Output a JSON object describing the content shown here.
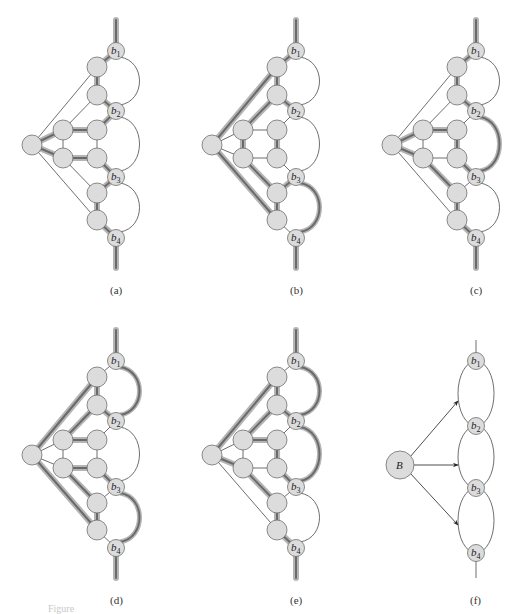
{
  "figure": {
    "colors": {
      "node_fill": "#dcdcdc",
      "node_stroke": "#6e6e6e",
      "thin_edge": "#4a4a4a",
      "highlight_outer": "#b5b5b5",
      "highlight_inner": "#6a6a6a",
      "background": "#ffffff"
    },
    "panels": [
      {
        "id": "a",
        "label": "(a)",
        "highlighted_paths": "root→inner-left-upper→inner-right-upper→b2; root→inner-left-lower→inner-right-lower→b3; chain b1–top1–top2–b2; chain b3–bot1–bot2–b4; stems",
        "highlighted_arcs": []
      },
      {
        "id": "b",
        "label": "(b)",
        "highlighted_paths": "root→top1 chain, root→bot2 chain, diagonals, vertical inner edges",
        "highlighted_arcs": [
          "b3-b4"
        ]
      },
      {
        "id": "c",
        "label": "(c)",
        "highlighted_paths": "root→inner upper/lower, inner-left-lower→bot1 diagonal",
        "highlighted_arcs": [
          "b2-b3"
        ]
      },
      {
        "id": "d",
        "label": "(d)",
        "highlighted_paths": "both outer diagonals, inner diagonals, horizontal edges",
        "highlighted_arcs": [
          "b1-b2",
          "b3-b4"
        ]
      },
      {
        "id": "e",
        "label": "(e)",
        "highlighted_paths": "upper outer diagonal, inner diagonals, horizontal upper edge",
        "highlighted_arcs": [
          "b1-b2",
          "b2-b3"
        ]
      },
      {
        "id": "f",
        "label": "(f)",
        "center_node_label": "B",
        "arrows": 3,
        "highlighted_arcs": []
      }
    ],
    "node_labels": {
      "b1": {
        "main": "b",
        "sub": "1"
      },
      "b2": {
        "main": "b",
        "sub": "2"
      },
      "b3": {
        "main": "b",
        "sub": "3"
      },
      "b4": {
        "main": "b",
        "sub": "4"
      },
      "B": "B"
    },
    "caption": "Figure"
  }
}
